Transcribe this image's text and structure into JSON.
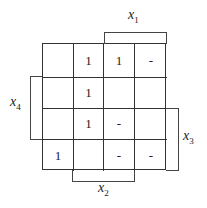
{
  "kmap": {
    "rows": 4,
    "cols": 4,
    "cells": [
      [
        "",
        "1",
        "1",
        "-"
      ],
      [
        "",
        "1",
        "",
        ""
      ],
      [
        "",
        "1",
        "-",
        ""
      ],
      [
        "1",
        "",
        "-",
        "-"
      ]
    ]
  },
  "labels": {
    "x1": {
      "var": "x",
      "sub": "1"
    },
    "x2": {
      "var": "x",
      "sub": "2"
    },
    "x3": {
      "var": "x",
      "sub": "3"
    },
    "x4": {
      "var": "x",
      "sub": "4"
    }
  }
}
